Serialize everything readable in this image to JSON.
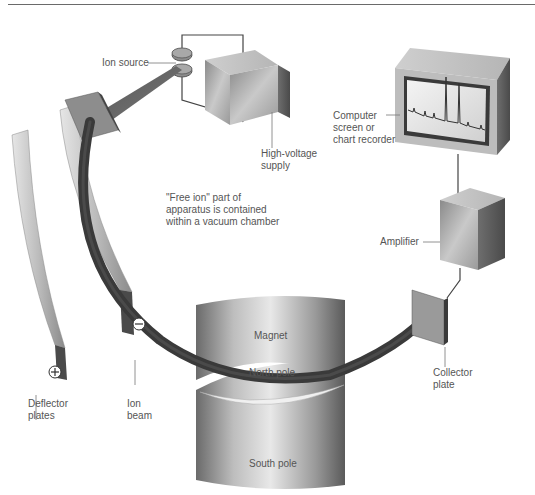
{
  "diagram": {
    "labels": {
      "ion_source": "Ion source",
      "high_voltage_supply": "High-voltage\nsupply",
      "computer_screen": "Computer\nscreen or\nchart recorder",
      "free_ion_note": "\"Free ion\" part of\napparatus is contained\nwithin a vacuum chamber",
      "amplifier": "Amplifier",
      "magnet": "Magnet",
      "north_pole": "North pole",
      "south_pole": "South pole",
      "collector_plate": "Collector\nplate",
      "deflector_plates": "Deflector\nplates",
      "ion_beam": "Ion\nbeam"
    },
    "symbols": {
      "negative_terminal": "−",
      "positive_terminal": "+"
    },
    "colors": {
      "beam": "#3a3a3a",
      "metal_light": "#d8d8d8",
      "metal_mid": "#a8a8a8",
      "metal_dark": "#5c5c5c",
      "label_text": "#555555",
      "leader_line": "#777777"
    }
  }
}
